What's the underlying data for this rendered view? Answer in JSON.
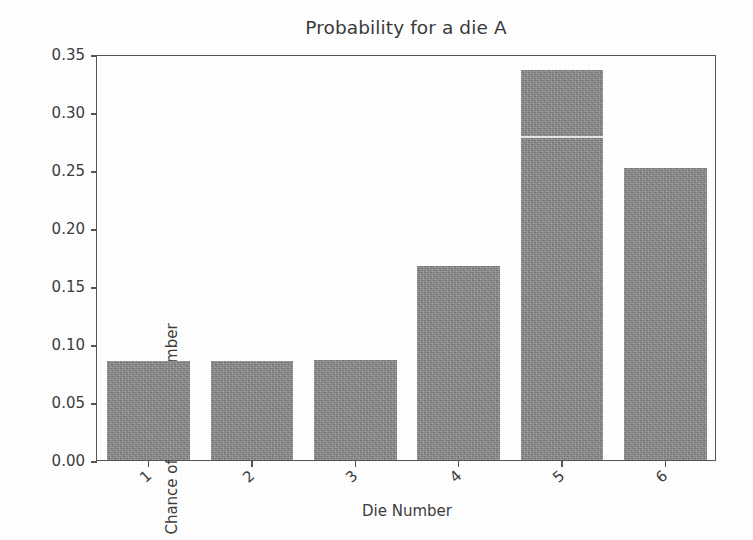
{
  "chart_data": {
    "type": "bar",
    "title": "Probability for a die A",
    "xlabel": "Die Number",
    "ylabel": "Chance of getting a number",
    "categories": [
      "1",
      "2",
      "3",
      "4",
      "5",
      "6"
    ],
    "values": [
      0.085,
      0.085,
      0.086,
      0.167,
      0.336,
      0.252
    ],
    "ylim": [
      0.0,
      0.35
    ],
    "ytick_labels": [
      "0.00",
      "0.05",
      "0.10",
      "0.15",
      "0.20",
      "0.25",
      "0.30",
      "0.35"
    ],
    "ytick_values": [
      0.0,
      0.05,
      0.1,
      0.15,
      0.2,
      0.25,
      0.3,
      0.35
    ],
    "grid": false,
    "legend": "none",
    "bar_color": "#8b8b8b",
    "background_color": "#ffffff",
    "axis_color": "#555555",
    "xtick_rotation": -42,
    "annotations": [
      "white horizontal scan line across bar 5"
    ]
  }
}
